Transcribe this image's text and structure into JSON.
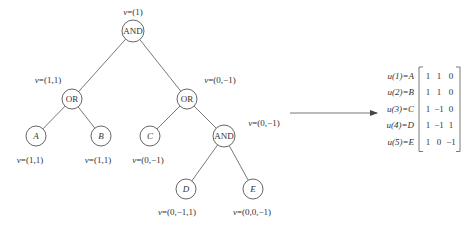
{
  "diagram": {
    "type": "and-or-tree-to-matrix",
    "nodes": [
      {
        "id": "root",
        "label": "AND",
        "italic": false,
        "cx": 133,
        "cy": 31,
        "r": 11,
        "v": "v=(1)",
        "v_x": 133,
        "v_y": 15,
        "v_anchor": "middle"
      },
      {
        "id": "or-left",
        "label": "OR",
        "italic": false,
        "cx": 72,
        "cy": 99,
        "r": 10,
        "v": "v=(1,1)",
        "v_x": 48,
        "v_y": 83,
        "v_anchor": "middle"
      },
      {
        "id": "or-right",
        "label": "OR",
        "italic": false,
        "cx": 187,
        "cy": 99,
        "r": 10,
        "v": "v=(0,−1)",
        "v_x": 220,
        "v_y": 83,
        "v_anchor": "middle"
      },
      {
        "id": "A",
        "label": "A",
        "italic": true,
        "cx": 36,
        "cy": 136,
        "r": 10,
        "v": "v=(1,1)",
        "v_x": 30,
        "v_y": 163,
        "v_anchor": "middle"
      },
      {
        "id": "B",
        "label": "B",
        "italic": true,
        "cx": 101,
        "cy": 136,
        "r": 10,
        "v": "v=(1,1)",
        "v_x": 98,
        "v_y": 163,
        "v_anchor": "middle"
      },
      {
        "id": "C",
        "label": "C",
        "italic": true,
        "cx": 150,
        "cy": 136,
        "r": 10,
        "v": "v=(0,−1)",
        "v_x": 148,
        "v_y": 163,
        "v_anchor": "middle"
      },
      {
        "id": "and-inner",
        "label": "AND",
        "italic": false,
        "cx": 224,
        "cy": 136,
        "r": 11,
        "v": "v=(0,−1)",
        "v_x": 264,
        "v_y": 126,
        "v_anchor": "middle"
      },
      {
        "id": "D",
        "label": "D",
        "italic": true,
        "cx": 186,
        "cy": 189,
        "r": 10,
        "v": "v=(0,−1,1)",
        "v_x": 177,
        "v_y": 215,
        "v_anchor": "middle"
      },
      {
        "id": "E",
        "label": "E",
        "italic": true,
        "cx": 253,
        "cy": 189,
        "r": 10,
        "v": "v=(0,0,−1)",
        "v_x": 252,
        "v_y": 215,
        "v_anchor": "middle"
      }
    ],
    "edges": [
      [
        "root",
        "or-left"
      ],
      [
        "root",
        "or-right"
      ],
      [
        "or-left",
        "A"
      ],
      [
        "or-left",
        "B"
      ],
      [
        "or-right",
        "C"
      ],
      [
        "or-right",
        "and-inner"
      ],
      [
        "and-inner",
        "D"
      ],
      [
        "and-inner",
        "E"
      ]
    ],
    "arrow": {
      "x1": 290,
      "y1": 113,
      "x2": 377,
      "y2": 113
    },
    "matrix": {
      "rows": [
        {
          "label": "u(1)=A",
          "values": [
            "1",
            "1",
            "0"
          ]
        },
        {
          "label": "u(2)=B",
          "values": [
            "1",
            "1",
            "0"
          ]
        },
        {
          "label": "u(3)=C",
          "values": [
            "1",
            "−1",
            "0"
          ]
        },
        {
          "label": "u(4)=D",
          "values": [
            "1",
            "−1",
            "1"
          ]
        },
        {
          "label": "u(5)=E",
          "values": [
            "1",
            "0",
            "−1"
          ]
        }
      ],
      "label_right_x": 414,
      "bracket_left_x": 419,
      "bracket_right_x": 460,
      "top_y": 67,
      "row_height": 16.5,
      "col_x": [
        428,
        439,
        451
      ]
    },
    "colors": {
      "stroke": "#555555",
      "text": "#333333",
      "background": "#ffffff"
    }
  }
}
